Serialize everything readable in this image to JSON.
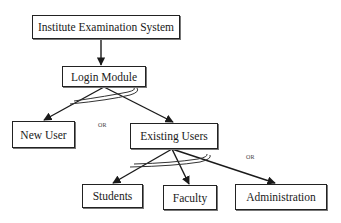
{
  "diagram": {
    "nodes": [
      {
        "id": "root",
        "label": "Institute Examination System"
      },
      {
        "id": "login",
        "label": "Login Module"
      },
      {
        "id": "new_user",
        "label": "New User"
      },
      {
        "id": "existing_users",
        "label": "Existing Users"
      },
      {
        "id": "students",
        "label": "Students"
      },
      {
        "id": "faculty",
        "label": "Faculty"
      },
      {
        "id": "administration",
        "label": "Administration"
      }
    ],
    "edges": [
      {
        "from": "root",
        "to": "login"
      },
      {
        "from": "login",
        "to": "new_user"
      },
      {
        "from": "login",
        "to": "existing_users"
      },
      {
        "from": "existing_users",
        "to": "students"
      },
      {
        "from": "existing_users",
        "to": "faculty"
      },
      {
        "from": "existing_users",
        "to": "administration"
      }
    ],
    "annotations": {
      "or_login": "OR",
      "or_existing": "OR"
    },
    "colors": {
      "line": "#1a1a1a",
      "border": "#222222",
      "background": "#ffffff"
    }
  }
}
